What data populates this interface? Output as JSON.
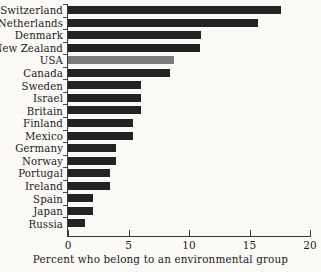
{
  "chart_data": {
    "type": "bar",
    "orientation": "horizontal",
    "title": "",
    "subtitle": "",
    "xlabel": "Percent who belong to an environmental group",
    "ylabel": "",
    "xlim": [
      0,
      20
    ],
    "xticks": [
      0,
      5,
      10,
      15,
      20
    ],
    "xtick_labels": [
      "0",
      "5",
      "10",
      "15",
      "20"
    ],
    "grid": false,
    "legend": false,
    "categories": [
      "Switzerland",
      "Netherlands",
      "Denmark",
      "New Zealand",
      "USA",
      "Canada",
      "Sweden",
      "Israel",
      "Britain",
      "Finland",
      "Mexico",
      "Germany",
      "Norway",
      "Portugal",
      "Ireland",
      "Spain",
      "Japan",
      "Russia"
    ],
    "values": [
      17.6,
      15.7,
      11.0,
      10.9,
      8.8,
      8.4,
      6.0,
      6.0,
      6.0,
      5.4,
      5.4,
      4.0,
      4.0,
      3.5,
      3.5,
      2.1,
      2.1,
      1.4
    ],
    "highlight_category": "USA",
    "bar_color": "#232323",
    "highlight_color": "#7c7c7c",
    "background_color": "#fbfaf7",
    "axis_color": "#3a3a3a"
  }
}
